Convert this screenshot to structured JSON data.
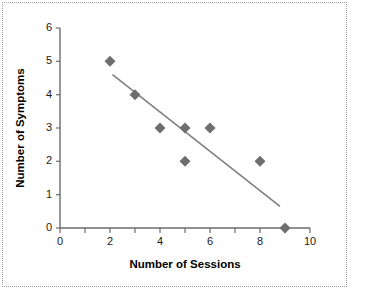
{
  "chart_data": {
    "type": "scatter",
    "title": "",
    "xlabel": "Number of Sessions",
    "ylabel": "Number of Symptoms",
    "xlim": [
      0,
      10
    ],
    "ylim": [
      0,
      6
    ],
    "grid": false,
    "legend": null,
    "x_ticks": [
      0,
      1,
      2,
      3,
      4,
      5,
      6,
      7,
      8,
      9,
      10
    ],
    "x_tick_labels": [
      "0",
      "",
      "2",
      "",
      "4",
      "",
      "6",
      "",
      "8",
      "",
      "10"
    ],
    "y_ticks": [
      0,
      1,
      2,
      3,
      4,
      5,
      6
    ],
    "y_tick_labels": [
      "0",
      "1",
      "2",
      "3",
      "4",
      "5",
      "6"
    ],
    "marker_shape": "diamond",
    "marker_color": "#6e6e6e",
    "points": [
      {
        "x": 2,
        "y": 5
      },
      {
        "x": 3,
        "y": 4
      },
      {
        "x": 4,
        "y": 3
      },
      {
        "x": 5,
        "y": 3
      },
      {
        "x": 6,
        "y": 3
      },
      {
        "x": 5,
        "y": 2
      },
      {
        "x": 8,
        "y": 2
      },
      {
        "x": 9,
        "y": 0
      }
    ],
    "trend_line": {
      "color": "#7d7d7d",
      "x_start": 2.1,
      "y_start": 4.6,
      "x_end": 8.8,
      "y_end": 0.65
    }
  }
}
